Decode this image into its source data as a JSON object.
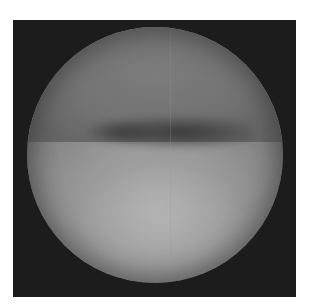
{
  "image": {
    "description": "Grayscale circular endoscopic-style view with dark frame",
    "colors": {
      "frame": "#1c1c1c",
      "upper_region": "#737373",
      "dark_band": "#3a3a3a",
      "lower_region": "#a8a8a8",
      "background": "#ffffff"
    }
  }
}
